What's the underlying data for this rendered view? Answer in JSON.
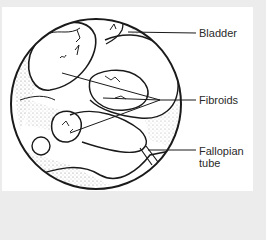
{
  "figure": {
    "type": "anatomical-illustration",
    "colors": {
      "background": "#ececec",
      "panel": "#ffffff",
      "ink": "#1a1a1a",
      "label_text": "#2a2a2a"
    },
    "labels": [
      {
        "id": "bladder",
        "text": "Bladder"
      },
      {
        "id": "fibroids",
        "text": "Fibroids"
      },
      {
        "id": "fallopian",
        "line1": "Fallopian",
        "line2": "tube"
      }
    ]
  }
}
